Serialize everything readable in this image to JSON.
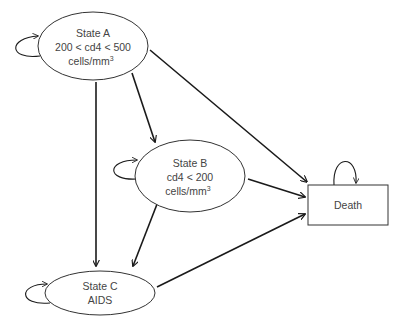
{
  "diagram": {
    "type": "state-transition",
    "colors": {
      "stroke": "#1a1a1a",
      "node_border": "#333333",
      "text": "#444444",
      "background": "#ffffff"
    },
    "nodes": [
      {
        "id": "A",
        "shape": "ellipse",
        "lines": [
          "State A",
          "200 < cd4 < 500",
          "cells/mm"
        ],
        "sup": "3",
        "self_loop": true
      },
      {
        "id": "B",
        "shape": "ellipse",
        "lines": [
          "State B",
          "cd4 < 200",
          "cells/mm"
        ],
        "sup": "3",
        "self_loop": true
      },
      {
        "id": "C",
        "shape": "ellipse",
        "lines": [
          "State C",
          "AIDS"
        ],
        "self_loop": true
      },
      {
        "id": "D",
        "shape": "rectangle",
        "lines": [
          "Death"
        ],
        "self_loop": true
      }
    ],
    "edges": [
      {
        "from": "A",
        "to": "B"
      },
      {
        "from": "A",
        "to": "C"
      },
      {
        "from": "A",
        "to": "D"
      },
      {
        "from": "B",
        "to": "C"
      },
      {
        "from": "B",
        "to": "D"
      },
      {
        "from": "C",
        "to": "D"
      }
    ]
  },
  "labels": {
    "A": {
      "l1": "State A",
      "l2": "200 < cd4 < 500",
      "l3": "cells/mm",
      "sup": "3"
    },
    "B": {
      "l1": "State B",
      "l2": "cd4 < 200",
      "l3": "cells/mm",
      "sup": "3"
    },
    "C": {
      "l1": "State C",
      "l2": "AIDS"
    },
    "D": {
      "l1": "Death"
    }
  }
}
